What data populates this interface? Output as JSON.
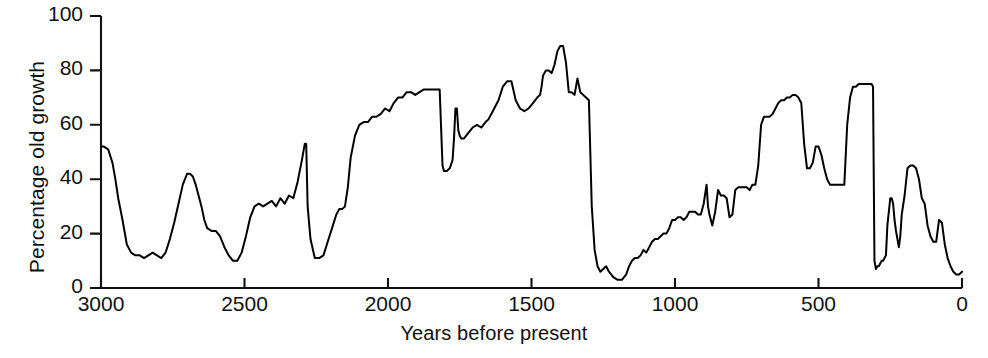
{
  "chart_data": {
    "type": "line",
    "title": "",
    "xlabel": "Years before present",
    "ylabel": "Percentage old growth",
    "xlim": [
      3000,
      0
    ],
    "ylim": [
      0,
      100
    ],
    "x_reversed": true,
    "grid": false,
    "legend": null,
    "line_color": "#000000",
    "background": "#ffffff",
    "xticks": [
      3000,
      2500,
      2000,
      1500,
      1000,
      500,
      0
    ],
    "xtick_labels": [
      "3000",
      "2500",
      "2000",
      "1500",
      "1000",
      "500",
      "0"
    ],
    "yticks": [
      0,
      20,
      40,
      60,
      80,
      100
    ],
    "ytick_labels": [
      "0",
      "20",
      "40",
      "60",
      "80",
      "100"
    ],
    "series_name": "Percentage old growth",
    "x": [
      3000,
      2990,
      2975,
      2960,
      2950,
      2940,
      2925,
      2910,
      2895,
      2880,
      2865,
      2850,
      2835,
      2820,
      2805,
      2790,
      2775,
      2760,
      2745,
      2730,
      2715,
      2700,
      2690,
      2680,
      2670,
      2660,
      2650,
      2640,
      2630,
      2615,
      2600,
      2585,
      2570,
      2555,
      2540,
      2525,
      2510,
      2495,
      2480,
      2465,
      2450,
      2435,
      2420,
      2405,
      2390,
      2375,
      2360,
      2345,
      2330,
      2315,
      2300,
      2290,
      2285,
      2280,
      2270,
      2255,
      2240,
      2225,
      2210,
      2195,
      2180,
      2170,
      2160,
      2150,
      2140,
      2130,
      2115,
      2100,
      2085,
      2070,
      2055,
      2040,
      2025,
      2010,
      1995,
      1980,
      1965,
      1950,
      1935,
      1920,
      1905,
      1890,
      1875,
      1860,
      1845,
      1830,
      1820,
      1810,
      1805,
      1800,
      1795,
      1785,
      1775,
      1770,
      1765,
      1760,
      1755,
      1750,
      1745,
      1735,
      1720,
      1705,
      1690,
      1675,
      1660,
      1650,
      1640,
      1630,
      1615,
      1600,
      1585,
      1570,
      1555,
      1540,
      1525,
      1510,
      1495,
      1480,
      1470,
      1465,
      1460,
      1455,
      1450,
      1445,
      1440,
      1430,
      1420,
      1410,
      1400,
      1390,
      1380,
      1370,
      1360,
      1350,
      1340,
      1330,
      1320,
      1310,
      1300,
      1290,
      1280,
      1270,
      1260,
      1250,
      1240,
      1230,
      1215,
      1200,
      1185,
      1170,
      1160,
      1150,
      1140,
      1130,
      1120,
      1110,
      1100,
      1090,
      1080,
      1070,
      1060,
      1050,
      1040,
      1030,
      1020,
      1010,
      1000,
      990,
      980,
      970,
      960,
      950,
      940,
      930,
      920,
      910,
      900,
      890,
      885,
      880,
      875,
      870,
      860,
      850,
      840,
      830,
      820,
      810,
      800,
      790,
      780,
      770,
      760,
      750,
      740,
      730,
      720,
      710,
      700,
      690,
      680,
      670,
      660,
      650,
      640,
      630,
      620,
      610,
      600,
      590,
      580,
      570,
      560,
      550,
      540,
      530,
      520,
      510,
      500,
      490,
      480,
      470,
      460,
      450,
      440,
      430,
      420,
      410,
      400,
      390,
      380,
      370,
      360,
      350,
      340,
      330,
      320,
      315,
      310,
      305,
      300,
      295,
      290,
      285,
      280,
      275,
      270,
      265,
      260,
      250,
      245,
      240,
      235,
      230,
      225,
      220,
      215,
      210,
      200,
      190,
      180,
      170,
      160,
      150,
      140,
      130,
      120,
      110,
      100,
      90,
      80,
      70,
      60,
      50,
      40,
      30,
      20,
      10,
      0
    ],
    "y": [
      52,
      52,
      51,
      46,
      40,
      33,
      25,
      16,
      13,
      12,
      12,
      11,
      12,
      13,
      12,
      11,
      13,
      18,
      24,
      31,
      38,
      42,
      42,
      41,
      38,
      34,
      30,
      25,
      22,
      21,
      21,
      19,
      15,
      12,
      10,
      10,
      13,
      19,
      26,
      30,
      31,
      30,
      31,
      32,
      30,
      33,
      31,
      34,
      33,
      39,
      47,
      53,
      53,
      30,
      18,
      11,
      11,
      12,
      17,
      22,
      27,
      29,
      29,
      30,
      37,
      48,
      56,
      60,
      61,
      61,
      63,
      63,
      64,
      66,
      65,
      68,
      70,
      70,
      72,
      72,
      71,
      72,
      73,
      73,
      73,
      73,
      73,
      45,
      43,
      43,
      43,
      44,
      47,
      55,
      66,
      66,
      58,
      56,
      55,
      55,
      57,
      59,
      60,
      59,
      61,
      62,
      64,
      66,
      69,
      74,
      76,
      76,
      69,
      66,
      65,
      66,
      68,
      70,
      71,
      74,
      78,
      79,
      80,
      80,
      80,
      79,
      82,
      87,
      89,
      89,
      83,
      72,
      72,
      71,
      77,
      72,
      71,
      70,
      69,
      30,
      14,
      8,
      6,
      7,
      8,
      6,
      4,
      3,
      3,
      5,
      8,
      10,
      11,
      11,
      12,
      14,
      13,
      15,
      17,
      18,
      18,
      19,
      20,
      20,
      22,
      25,
      25,
      26,
      26,
      25,
      26,
      28,
      28,
      28,
      27,
      27,
      31,
      38,
      30,
      27,
      25,
      23,
      28,
      36,
      34,
      34,
      33,
      26,
      27,
      36,
      37,
      37,
      37,
      37,
      36,
      38,
      38,
      45,
      60,
      63,
      63,
      63,
      64,
      66,
      68,
      69,
      69,
      70,
      70,
      71,
      71,
      70,
      68,
      53,
      44,
      44,
      46,
      52,
      52,
      49,
      44,
      40,
      38,
      38,
      38,
      38,
      38,
      38,
      60,
      70,
      74,
      74,
      75,
      75,
      75,
      75,
      75,
      75,
      74,
      10,
      7,
      8,
      8,
      9,
      10,
      10,
      11,
      12,
      23,
      33,
      33,
      31,
      25,
      21,
      18,
      15,
      19,
      27,
      34,
      44,
      45,
      45,
      44,
      40,
      33,
      31,
      23,
      19,
      17,
      17,
      25,
      24,
      16,
      11,
      8,
      6,
      5,
      5,
      6,
      9,
      11,
      15,
      19,
      24,
      28,
      31,
      35,
      42,
      50,
      62,
      78,
      90,
      85,
      79,
      79,
      64,
      56,
      55,
      54,
      54,
      54,
      60,
      60,
      45,
      41,
      41,
      40,
      31,
      29,
      29,
      29,
      29,
      24,
      26,
      31,
      34,
      35,
      36,
      36,
      36,
      37,
      37,
      36,
      41,
      38,
      39,
      44,
      46,
      47,
      47
    ],
    "features": {
      "series_start_value": 52,
      "max_value": 90,
      "max_at_years_bp": 310,
      "min_value": 3,
      "min_at_years_bp": 1640,
      "end_value": 47
    }
  }
}
